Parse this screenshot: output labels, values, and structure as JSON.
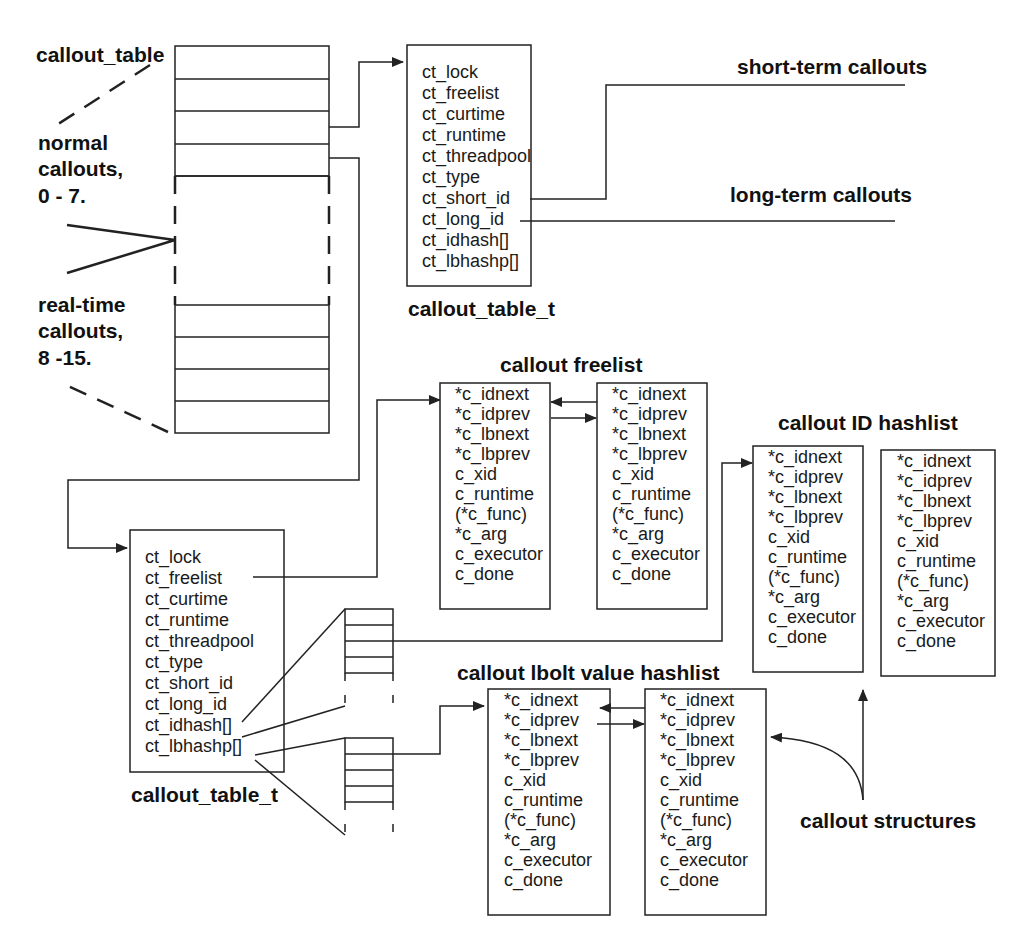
{
  "labels": {
    "callout_table": "callout_table",
    "normal_callouts": [
      "normal",
      "callouts,",
      "0 - 7."
    ],
    "realtime_callouts": [
      "real-time",
      "callouts,",
      "8 -15."
    ],
    "short_term": "short-term callouts",
    "long_term": "long-term callouts",
    "callout_freelist": "callout freelist",
    "callout_id_hashlist": "callout ID hashlist",
    "callout_lbolt_hashlist": "callout lbolt value hashlist",
    "callout_structures": "callout structures",
    "table_type_top": "callout_table_t",
    "table_type_bottom": "callout_table_t"
  },
  "callout_table_t_fields": [
    "ct_lock",
    "ct_freelist",
    "ct_curtime",
    "ct_runtime",
    "ct_threadpool",
    "ct_type",
    "ct_short_id",
    "ct_long_id",
    "ct_idhash[]",
    "ct_lbhashp[]"
  ],
  "callout_fields": [
    "*c_idnext",
    "*c_idprev",
    "*c_lbnext",
    "*c_lbprev",
    "c_xid",
    "c_runtime",
    "(*c_func)",
    "*c_arg",
    "c_executor",
    "c_done"
  ],
  "colors": {
    "line": "#222222",
    "background": "#ffffff",
    "text": "#111111"
  }
}
